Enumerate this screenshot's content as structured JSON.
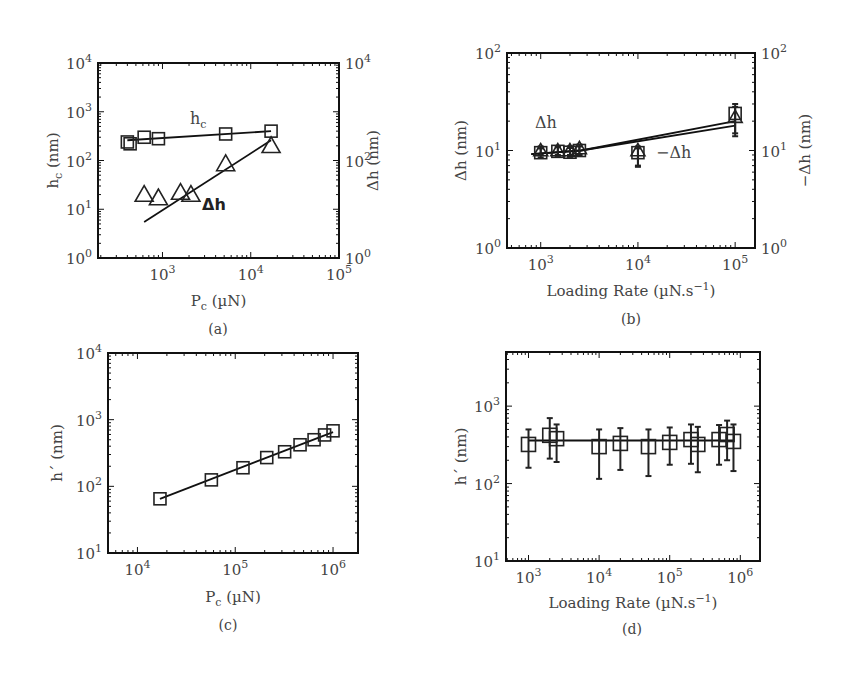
{
  "figure": {
    "panels": [
      {
        "id": "a",
        "caption": "(a)"
      },
      {
        "id": "b",
        "caption": "(b)"
      },
      {
        "id": "c",
        "caption": "(c)"
      },
      {
        "id": "d",
        "caption": "(d)"
      }
    ]
  },
  "chart_data": [
    {
      "panel": "(a)",
      "type": "scatter",
      "xlabel": "P_c (µN)",
      "ylabel": "h_c (nm)",
      "ylabel_right": "Δh (nm)",
      "xscale": "log",
      "yscale": "log",
      "xlim": [
        186,
        100000
      ],
      "ylim": [
        1,
        10000
      ],
      "xticks": [
        "10^3",
        "10^4",
        "10^5"
      ],
      "yticks": [
        "10^0",
        "10^1",
        "10^2",
        "10^3",
        "10^4"
      ],
      "yticks_right": [
        "10^0",
        "10^2",
        "10^4"
      ],
      "grid": false,
      "annotations": [
        "h_c",
        "Δh"
      ],
      "series": [
        {
          "name": "h_c",
          "marker": "square",
          "x": [
            400,
            430,
            620,
            900,
            5200,
            17000
          ],
          "y": [
            240,
            220,
            300,
            280,
            350,
            400
          ],
          "fit": {
            "x": [
              400,
              17000
            ],
            "y": [
              260,
              400
            ]
          }
        },
        {
          "name": "Δh",
          "marker": "triangle",
          "x": [
            620,
            900,
            1600,
            2100,
            5200,
            17000
          ],
          "y": [
            20,
            17,
            22,
            20,
            85,
            200
          ],
          "fit": {
            "x": [
              620,
              17000
            ],
            "y": [
              5.5,
              260
            ]
          }
        }
      ]
    },
    {
      "panel": "(b)",
      "type": "scatter",
      "xlabel": "Loading Rate (µN.s⁻¹)",
      "ylabel": "Δh (nm)",
      "ylabel_right": "−Δh (nm)",
      "xscale": "log",
      "yscale": "log",
      "xlim": [
        450,
        160000
      ],
      "ylim": [
        1,
        100
      ],
      "xticks": [
        "10^3",
        "10^4",
        "10^5"
      ],
      "yticks": [
        "10^0",
        "10^1",
        "10^2"
      ],
      "yticks_right": [
        "10^0",
        "10^1",
        "10^2"
      ],
      "grid": false,
      "annotations": [
        "Δh",
        "−Δh"
      ],
      "series": [
        {
          "name": "Δh",
          "marker": "triangle",
          "x": [
            1000,
            1500,
            2000,
            2500,
            10000,
            100000
          ],
          "y": [
            10,
            10,
            10,
            10.5,
            10,
            22
          ],
          "yerr_low": [
            9,
            9,
            9,
            9,
            7,
            15
          ],
          "yerr_high": [
            11,
            11,
            11,
            11.5,
            11,
            28
          ],
          "fit": {
            "x": [
              800,
              2600,
              100000
            ],
            "y": [
              9.2,
              10,
              20
            ]
          }
        },
        {
          "name": "−Δh",
          "marker": "square",
          "x": [
            1000,
            1500,
            2000,
            2500,
            10000,
            100000
          ],
          "y": [
            9.5,
            9.8,
            9.6,
            10,
            9.5,
            24
          ],
          "yerr_low": [
            8.5,
            8.8,
            8.6,
            9,
            6.8,
            14
          ],
          "yerr_high": [
            10.5,
            10.8,
            10.6,
            11,
            10.5,
            30
          ],
          "fit": {
            "x": [
              800,
              2600,
              100000
            ],
            "y": [
              9.2,
              10,
              18
            ]
          }
        }
      ]
    },
    {
      "panel": "(c)",
      "type": "scatter",
      "xlabel": "P_c (µN)",
      "ylabel": "h´ (nm)",
      "xscale": "log",
      "yscale": "log",
      "xlim": [
        5000,
        1800000
      ],
      "ylim": [
        10,
        10000
      ],
      "xticks": [
        "10^4",
        "10^5",
        "10^6"
      ],
      "yticks": [
        "10^1",
        "10^2",
        "10^3",
        "10^4"
      ],
      "grid": false,
      "series": [
        {
          "name": "h´",
          "marker": "square",
          "x": [
            17000,
            57000,
            120000,
            210000,
            320000,
            460000,
            640000,
            820000,
            1000000
          ],
          "y": [
            65,
            125,
            190,
            270,
            330,
            420,
            500,
            590,
            680
          ],
          "fit": {
            "x": [
              17000,
              1000000
            ],
            "y": [
              65,
              650
            ]
          }
        }
      ]
    },
    {
      "panel": "(d)",
      "type": "scatter",
      "xlabel": "Loading Rate (µN.s⁻¹)",
      "ylabel": "h´ (nm)",
      "xscale": "log",
      "yscale": "log",
      "xlim": [
        480,
        1900000
      ],
      "ylim": [
        10,
        5000
      ],
      "xticks": [
        "10^3",
        "10^4",
        "10^5",
        "10^6"
      ],
      "yticks": [
        "10^1",
        "10^2",
        "10^3"
      ],
      "grid": false,
      "series": [
        {
          "name": "h´",
          "marker": "square",
          "x": [
            1000,
            2000,
            2500,
            10000,
            20000,
            50000,
            100000,
            200000,
            250000,
            500000,
            650000,
            800000
          ],
          "y": [
            320,
            420,
            380,
            300,
            330,
            300,
            340,
            370,
            320,
            370,
            430,
            350
          ],
          "yerr_low": [
            160,
            210,
            190,
            115,
            150,
            125,
            175,
            180,
            140,
            175,
            200,
            145
          ],
          "yerr_high": [
            500,
            700,
            580,
            500,
            520,
            500,
            530,
            580,
            540,
            570,
            650,
            580
          ],
          "fit": {
            "x": [
              1000,
              800000
            ],
            "y": [
              360,
              360
            ]
          }
        }
      ]
    }
  ]
}
